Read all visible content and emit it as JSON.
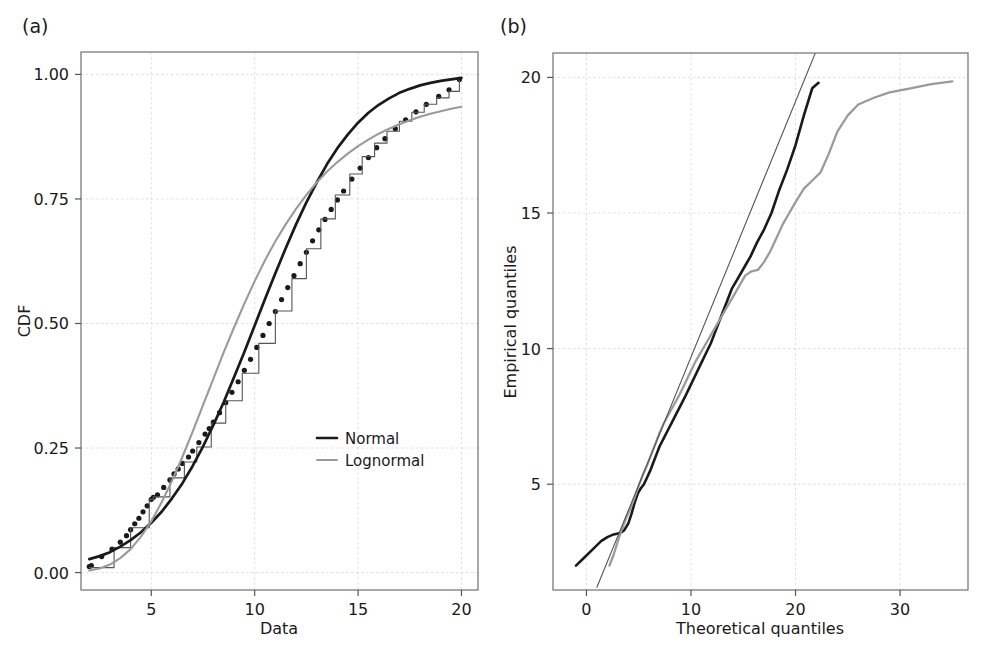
{
  "figure": {
    "background": "#ffffff",
    "panels": [
      {
        "key": "a",
        "label": "(a)"
      },
      {
        "key": "b",
        "label": "(b)"
      }
    ]
  },
  "colors": {
    "normal": "#1a1a1a",
    "lognormal": "#9a9a9a",
    "empirical": "#1a1a1a",
    "frame": "#7a7a7a",
    "grid": "#d8dce2",
    "text": "#1a1a1a"
  },
  "panel_a": {
    "label": "(a)",
    "xlabel": "Data",
    "ylabel": "CDF",
    "xticks": [
      5,
      10,
      15,
      20
    ],
    "xtick_labels": [
      "5",
      "10",
      "15",
      "20"
    ],
    "yticks": [
      0.0,
      0.25,
      0.5,
      0.75,
      1.0
    ],
    "ytick_labels": [
      "0.00",
      "0.25",
      "0.50",
      "0.75",
      "1.00"
    ],
    "xlim": [
      1.6,
      20.8
    ],
    "ylim": [
      -0.035,
      1.045
    ],
    "legend": {
      "position": "bottom-right",
      "entries": [
        {
          "label": "Normal",
          "color": "#1a1a1a",
          "width": 2.6
        },
        {
          "label": "Lognormal",
          "color": "#9a9a9a",
          "width": 2.0
        }
      ]
    }
  },
  "panel_b": {
    "label": "(b)",
    "xlabel": "Theoretical quantiles",
    "ylabel": "Empirical quantiles",
    "xticks": [
      0,
      10,
      20,
      30
    ],
    "xtick_labels": [
      "0",
      "10",
      "20",
      "30"
    ],
    "yticks": [
      5,
      10,
      15,
      20
    ],
    "ytick_labels": [
      "5",
      "10",
      "15",
      "20"
    ],
    "xlim": [
      -3.2,
      36.5
    ],
    "ylim": [
      1.1,
      20.9
    ]
  },
  "chart_data": [
    {
      "id": "panel-a",
      "type": "line",
      "title": "(a)",
      "xlabel": "Data",
      "ylabel": "CDF",
      "xlim": [
        1.6,
        20.8
      ],
      "ylim": [
        -0.035,
        1.045
      ],
      "xticks": [
        5,
        10,
        15,
        20
      ],
      "yticks": [
        0.0,
        0.25,
        0.5,
        0.75,
        1.0
      ],
      "grid": true,
      "legend": [
        "Normal",
        "Lognormal"
      ],
      "legend_position": "lower-right",
      "series": [
        {
          "name": "Empirical CDF (data points)",
          "style": "dots",
          "color": "#1a1a1a",
          "x": [
            2.0,
            2.1,
            2.6,
            3.1,
            3.5,
            3.8,
            4.0,
            4.2,
            4.4,
            4.6,
            4.8,
            5.0,
            5.1,
            5.3,
            5.6,
            5.9,
            6.1,
            6.3,
            6.5,
            6.8,
            7.0,
            7.3,
            7.6,
            7.8,
            8.0,
            8.3,
            8.6,
            8.9,
            9.2,
            9.5,
            9.8,
            10.1,
            10.4,
            10.7,
            11.0,
            11.3,
            11.6,
            11.9,
            12.2,
            12.5,
            12.8,
            13.1,
            13.4,
            13.7,
            14.0,
            14.3,
            14.7,
            15.1,
            15.5,
            15.9,
            16.3,
            16.8,
            17.3,
            17.8,
            18.3,
            18.9,
            19.4,
            19.9
          ],
          "y": [
            0.012,
            0.014,
            0.032,
            0.047,
            0.061,
            0.074,
            0.086,
            0.098,
            0.109,
            0.122,
            0.134,
            0.147,
            0.151,
            0.156,
            0.171,
            0.186,
            0.198,
            0.208,
            0.219,
            0.232,
            0.244,
            0.261,
            0.278,
            0.289,
            0.302,
            0.321,
            0.341,
            0.362,
            0.383,
            0.406,
            0.428,
            0.452,
            0.476,
            0.5,
            0.524,
            0.548,
            0.572,
            0.596,
            0.62,
            0.643,
            0.666,
            0.688,
            0.709,
            0.729,
            0.748,
            0.766,
            0.79,
            0.812,
            0.833,
            0.853,
            0.871,
            0.891,
            0.909,
            0.925,
            0.94,
            0.956,
            0.969,
            0.99
          ]
        },
        {
          "name": "Empirical step CDF",
          "style": "step",
          "color": "#555555",
          "x": [
            2.0,
            3.2,
            4.0,
            4.9,
            5.1,
            5.9,
            6.6,
            7.2,
            7.9,
            8.6,
            9.4,
            10.2,
            11.0,
            11.8,
            12.5,
            13.2,
            13.9,
            14.6,
            15.2,
            15.8,
            16.4,
            17.0,
            17.6,
            18.2,
            18.8,
            19.4,
            19.9
          ],
          "y": [
            0.01,
            0.05,
            0.09,
            0.147,
            0.152,
            0.19,
            0.222,
            0.252,
            0.3,
            0.345,
            0.4,
            0.46,
            0.525,
            0.59,
            0.65,
            0.71,
            0.758,
            0.8,
            0.835,
            0.862,
            0.886,
            0.906,
            0.924,
            0.94,
            0.953,
            0.966,
            0.99
          ]
        },
        {
          "name": "Normal",
          "style": "line",
          "color": "#1a1a1a",
          "width": 2.7,
          "x": [
            2.0,
            2.5,
            3.0,
            3.5,
            4.0,
            4.5,
            5.0,
            5.5,
            6.0,
            6.5,
            7.0,
            7.5,
            8.0,
            8.5,
            9.0,
            9.5,
            10.0,
            10.5,
            11.0,
            11.5,
            12.0,
            12.5,
            13.0,
            13.5,
            14.0,
            14.5,
            15.0,
            15.5,
            16.0,
            16.5,
            17.0,
            17.5,
            18.0,
            18.5,
            19.0,
            19.5,
            20.0
          ],
          "y": [
            0.027,
            0.033,
            0.041,
            0.052,
            0.065,
            0.081,
            0.1,
            0.122,
            0.149,
            0.179,
            0.214,
            0.253,
            0.296,
            0.342,
            0.392,
            0.443,
            0.496,
            0.549,
            0.601,
            0.651,
            0.699,
            0.743,
            0.783,
            0.82,
            0.852,
            0.879,
            0.903,
            0.923,
            0.939,
            0.952,
            0.963,
            0.971,
            0.978,
            0.983,
            0.987,
            0.99,
            0.993
          ]
        },
        {
          "name": "Lognormal",
          "style": "line",
          "color": "#9a9a9a",
          "width": 2.1,
          "x": [
            2.0,
            2.5,
            3.0,
            3.5,
            4.0,
            4.5,
            5.0,
            5.5,
            6.0,
            6.5,
            7.0,
            7.5,
            8.0,
            8.5,
            9.0,
            9.5,
            10.0,
            10.5,
            11.0,
            11.5,
            12.0,
            12.5,
            13.0,
            13.5,
            14.0,
            14.5,
            15.0,
            15.5,
            16.0,
            16.5,
            17.0,
            17.5,
            18.0,
            18.5,
            19.0,
            19.5,
            20.0
          ],
          "y": [
            0.004,
            0.008,
            0.016,
            0.029,
            0.047,
            0.072,
            0.103,
            0.141,
            0.184,
            0.232,
            0.283,
            0.336,
            0.389,
            0.442,
            0.492,
            0.54,
            0.585,
            0.627,
            0.665,
            0.699,
            0.73,
            0.758,
            0.783,
            0.805,
            0.824,
            0.841,
            0.856,
            0.869,
            0.881,
            0.891,
            0.9,
            0.908,
            0.915,
            0.921,
            0.926,
            0.931,
            0.935
          ]
        }
      ]
    },
    {
      "id": "panel-b",
      "type": "line",
      "title": "(b)",
      "xlabel": "Theoretical quantiles",
      "ylabel": "Empirical quantiles",
      "xlim": [
        -3.2,
        36.5
      ],
      "ylim": [
        1.1,
        20.9
      ],
      "xticks": [
        0,
        10,
        20,
        30
      ],
      "yticks": [
        5,
        10,
        15,
        20
      ],
      "grid": true,
      "series": [
        {
          "name": "Normal Q-Q",
          "style": "line",
          "color": "#1a1a1a",
          "width": 2.6,
          "x": [
            -1.0,
            -0.2,
            0.6,
            1.4,
            2.0,
            2.6,
            3.2,
            3.6,
            4.0,
            4.3,
            4.6,
            4.9,
            5.2,
            5.5,
            5.8,
            6.1,
            6.4,
            6.7,
            7.0,
            7.4,
            7.8,
            8.2,
            8.6,
            9.0,
            9.4,
            9.9,
            10.4,
            10.9,
            11.4,
            11.9,
            12.4,
            12.9,
            13.4,
            13.9,
            14.5,
            15.1,
            15.7,
            16.3,
            17.0,
            17.7,
            18.4,
            19.2,
            20.0,
            20.8,
            21.6,
            22.2
          ],
          "y": [
            2.0,
            2.3,
            2.6,
            2.9,
            3.05,
            3.15,
            3.2,
            3.3,
            3.55,
            3.9,
            4.3,
            4.65,
            4.85,
            5.0,
            5.25,
            5.5,
            5.8,
            6.1,
            6.4,
            6.7,
            7.0,
            7.3,
            7.6,
            7.9,
            8.2,
            8.6,
            9.0,
            9.4,
            9.8,
            10.2,
            10.7,
            11.2,
            11.7,
            12.2,
            12.6,
            13.0,
            13.4,
            13.9,
            14.4,
            15.0,
            15.8,
            16.6,
            17.5,
            18.6,
            19.6,
            19.8
          ]
        },
        {
          "name": "Lognormal Q-Q",
          "style": "line",
          "color": "#9a9a9a",
          "width": 2.3,
          "x": [
            2.2,
            2.6,
            3.0,
            3.4,
            3.8,
            4.2,
            4.6,
            5.0,
            5.4,
            5.8,
            6.2,
            6.6,
            7.0,
            7.4,
            7.9,
            8.4,
            8.9,
            9.4,
            9.9,
            10.4,
            11.0,
            11.6,
            12.2,
            12.8,
            13.4,
            14.0,
            14.6,
            15.2,
            15.8,
            16.4,
            17.0,
            17.6,
            18.2,
            18.8,
            19.4,
            20.0,
            20.8,
            21.6,
            22.4,
            23.2,
            24.0,
            25.0,
            26.0,
            27.5,
            29.0,
            31.0,
            33.0,
            35.0
          ],
          "y": [
            2.0,
            2.4,
            2.9,
            3.35,
            3.75,
            4.1,
            4.5,
            4.95,
            5.35,
            5.7,
            6.1,
            6.5,
            6.9,
            7.25,
            7.6,
            7.95,
            8.3,
            8.7,
            9.1,
            9.5,
            9.9,
            10.3,
            10.7,
            11.1,
            11.5,
            11.9,
            12.3,
            12.7,
            12.85,
            12.9,
            13.2,
            13.6,
            14.1,
            14.6,
            15.0,
            15.4,
            15.9,
            16.2,
            16.5,
            17.2,
            18.0,
            18.6,
            19.0,
            19.25,
            19.45,
            19.6,
            19.75,
            19.85
          ]
        },
        {
          "name": "Reference line",
          "style": "line",
          "color": "#555555",
          "width": 1.1,
          "x": [
            1.0,
            22.0
          ],
          "y": [
            1.2,
            21.0
          ]
        }
      ]
    }
  ]
}
